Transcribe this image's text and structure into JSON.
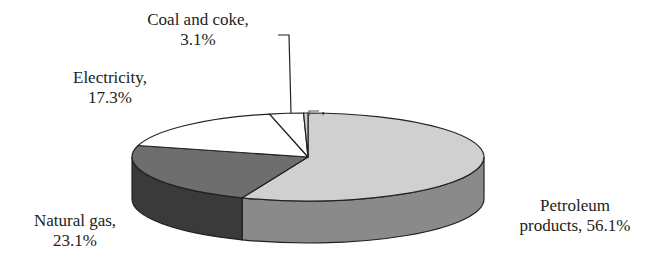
{
  "chart_data": {
    "type": "pie",
    "style": "3d",
    "title": "",
    "categories": [
      "Petroleum products",
      "Natural gas",
      "Electricity",
      "Coal and coke",
      "Other"
    ],
    "values": [
      56.1,
      23.1,
      17.3,
      3.1,
      0.4
    ],
    "labels": [
      {
        "name": "Petroleum products,",
        "value": "56.1%"
      },
      {
        "name": "Natural gas,",
        "value": "23.1%"
      },
      {
        "name": "Electricity,",
        "value": "17.3%"
      },
      {
        "name": "Coal and coke,",
        "value": "3.1%"
      },
      {
        "name": ",",
        "value": ""
      }
    ],
    "colors": {
      "petroleum_top": "#d0d0d0",
      "petroleum_side": "#8a8a8a",
      "natural_gas_top": "#6e6e6e",
      "natural_gas_side": "#3a3a3a",
      "electricity_top": "#ffffff",
      "coal_top": "#ffffff",
      "outline": "#222222"
    },
    "legend": "none"
  }
}
